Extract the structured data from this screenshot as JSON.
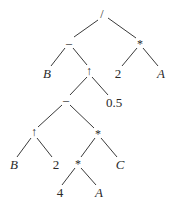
{
  "diagram": {
    "type": "expression-tree",
    "line_color": "#3a3a3a",
    "nodes": [
      {
        "id": "n0",
        "label": "/",
        "x": 102,
        "y": 14,
        "italic": false
      },
      {
        "id": "n1",
        "label": "–",
        "x": 69,
        "y": 43,
        "italic": false
      },
      {
        "id": "n2",
        "label": "*",
        "x": 140,
        "y": 43,
        "italic": false
      },
      {
        "id": "n3",
        "label": "B",
        "x": 47,
        "y": 73,
        "italic": true
      },
      {
        "id": "n4",
        "label": "↑",
        "x": 89,
        "y": 71,
        "italic": false
      },
      {
        "id": "n5",
        "label": "2",
        "x": 118,
        "y": 73,
        "italic": false
      },
      {
        "id": "n6",
        "label": "A",
        "x": 161,
        "y": 73,
        "italic": true
      },
      {
        "id": "n7",
        "label": "–",
        "x": 66,
        "y": 100,
        "italic": false
      },
      {
        "id": "n8",
        "label": "0.5",
        "x": 114,
        "y": 102,
        "italic": false
      },
      {
        "id": "n9",
        "label": "↑",
        "x": 34,
        "y": 132,
        "italic": false
      },
      {
        "id": "n10",
        "label": "*",
        "x": 98,
        "y": 133,
        "italic": false
      },
      {
        "id": "n11",
        "label": "B",
        "x": 14,
        "y": 164,
        "italic": true
      },
      {
        "id": "n12",
        "label": "2",
        "x": 56,
        "y": 164,
        "italic": false
      },
      {
        "id": "n13",
        "label": "*",
        "x": 78,
        "y": 163,
        "italic": false
      },
      {
        "id": "n14",
        "label": "C",
        "x": 120,
        "y": 164,
        "italic": true
      },
      {
        "id": "n15",
        "label": "4",
        "x": 60,
        "y": 192,
        "italic": false
      },
      {
        "id": "n16",
        "label": "A",
        "x": 99,
        "y": 192,
        "italic": true
      }
    ],
    "edges": [
      [
        "n0",
        "n1"
      ],
      [
        "n0",
        "n2"
      ],
      [
        "n1",
        "n3"
      ],
      [
        "n1",
        "n4"
      ],
      [
        "n2",
        "n5"
      ],
      [
        "n2",
        "n6"
      ],
      [
        "n4",
        "n7"
      ],
      [
        "n4",
        "n8"
      ],
      [
        "n7",
        "n9"
      ],
      [
        "n7",
        "n10"
      ],
      [
        "n9",
        "n11"
      ],
      [
        "n9",
        "n12"
      ],
      [
        "n10",
        "n13"
      ],
      [
        "n10",
        "n14"
      ],
      [
        "n13",
        "n15"
      ],
      [
        "n13",
        "n16"
      ]
    ]
  }
}
